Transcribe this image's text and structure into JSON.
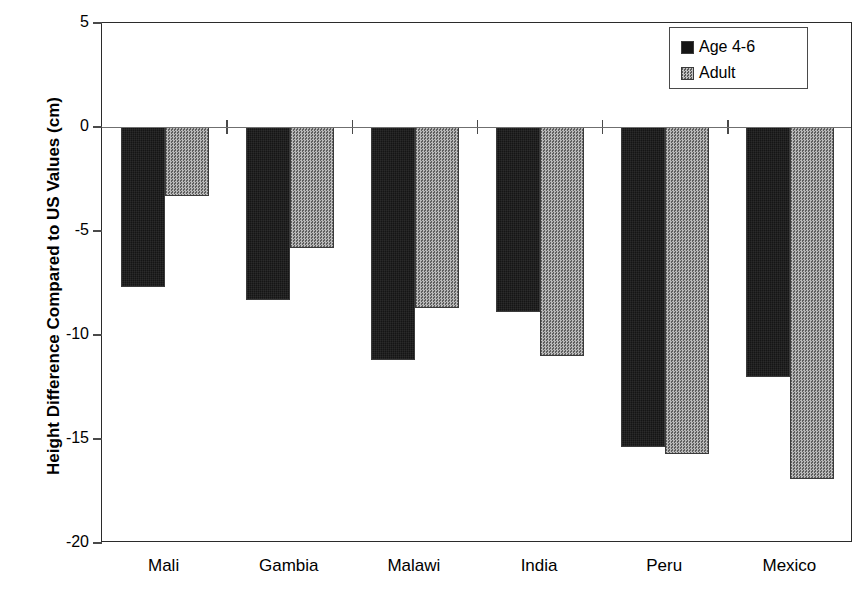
{
  "chart_data": {
    "type": "bar",
    "title": "",
    "subtitle": "",
    "xlabel": "",
    "ylabel": "Height Difference Compared to US Values (cm)",
    "categories": [
      "Mali",
      "Gambia",
      "Malawi",
      "India",
      "Peru",
      "Mexico"
    ],
    "series": [
      {
        "name": "Age 4-6",
        "values": [
          -7.7,
          -8.3,
          -11.2,
          -8.9,
          -15.4,
          -12.0
        ],
        "color": "#151515"
      },
      {
        "name": "Adult",
        "values": [
          -3.3,
          -5.8,
          -8.7,
          -11.0,
          -15.7,
          -16.9
        ],
        "color": "#8e8e8e"
      }
    ],
    "ylim": [
      -20,
      5
    ],
    "yticks": [
      5,
      0,
      -5,
      -10,
      -15,
      -20
    ],
    "ytick_labels": [
      "5",
      "0",
      "-5",
      "-10",
      "-15",
      "-20"
    ],
    "grid": false,
    "legend_position": "top-right",
    "zero_line": true,
    "annotations": []
  },
  "legend": {
    "entries": [
      {
        "label": "Age 4-6",
        "swatch": "dark-solid-swatch"
      },
      {
        "label": "Adult",
        "swatch": "gray-dither-swatch"
      }
    ]
  },
  "axes": {
    "y_title": "Height Difference Compared to US Values (cm)"
  }
}
